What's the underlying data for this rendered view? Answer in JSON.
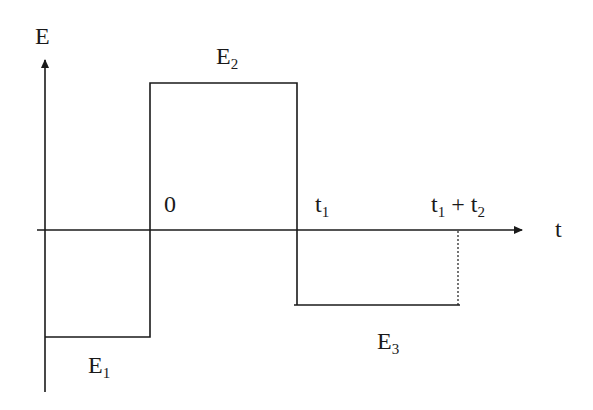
{
  "diagram": {
    "axes": {
      "y_label": "E",
      "x_label": "t"
    },
    "labels": {
      "origin": "0",
      "t1": "t",
      "t1_sub": "1",
      "t1t2_a": "t",
      "t1t2_a_sub": "1",
      "t1t2_plus": " + t",
      "t1t2_b_sub": "2"
    },
    "segments": [
      {
        "name": "E",
        "sub": "1",
        "interval": "before 0",
        "level": "negative"
      },
      {
        "name": "E",
        "sub": "2",
        "interval": "0 to t1",
        "level": "positive"
      },
      {
        "name": "E",
        "sub": "3",
        "interval": "t1 to t1 + t2",
        "level": "negative"
      }
    ],
    "colors": {
      "line": "#1a1a1a",
      "background": "#ffffff"
    }
  }
}
